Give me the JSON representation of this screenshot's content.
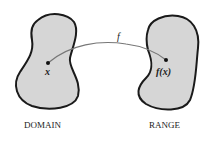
{
  "diagram": {
    "domain": {
      "label": "DOMAIN",
      "point_label": "x"
    },
    "range": {
      "label": "RANGE",
      "point_label": "f(x)"
    },
    "arrow": {
      "label": "f"
    },
    "colors": {
      "region_fill": "#d6d6d6",
      "outline": "#1a1a1a",
      "curve": "#777777",
      "text": "#222222"
    }
  }
}
